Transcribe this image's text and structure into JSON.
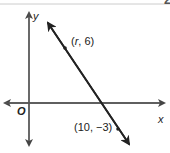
{
  "corner_label": "2",
  "axes": {
    "x_label": "x",
    "y_label": "y",
    "origin_label": "O"
  },
  "points": [
    {
      "label_prefix": "(",
      "var": "r",
      "label_suffix": ", 6)"
    },
    {
      "label": "(10, −3)"
    }
  ],
  "colors": {
    "line": "#333333",
    "axis": "#555555",
    "border": "#cccccc"
  }
}
